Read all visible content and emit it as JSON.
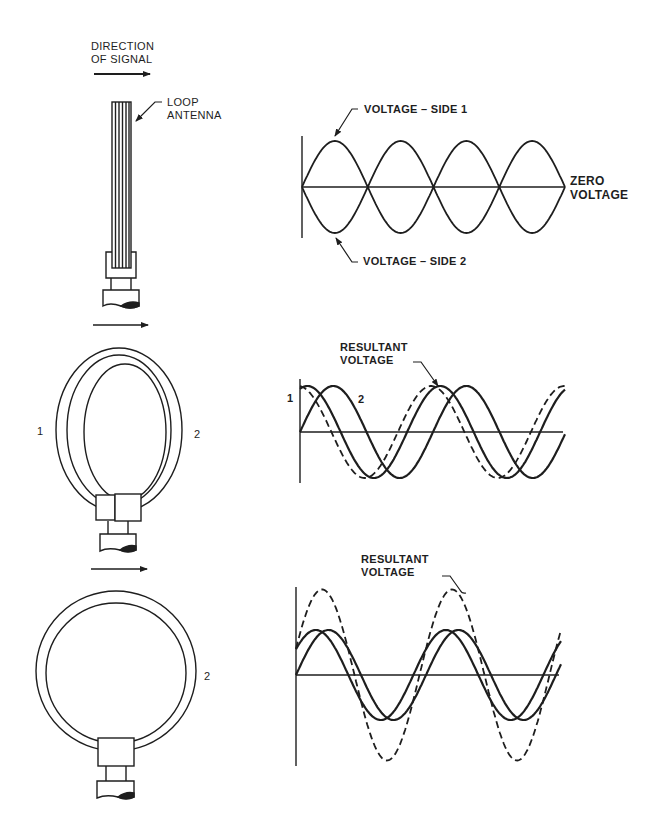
{
  "labels": {
    "direction_line1": "DIRECTION",
    "direction_line2": "OF SIGNAL",
    "loop_antenna_line1": "LOOP",
    "loop_antenna_line2": "ANTENNA",
    "voltage_side1": "VOLTAGE – SIDE 1",
    "voltage_side2": "VOLTAGE – SIDE 2",
    "zero_line1": "ZERO",
    "zero_line2": "VOLTAGE",
    "resultant_mid_line1": "RESULTANT",
    "resultant_mid_line2": "VOLTAGE",
    "resultant_bot_line1": "RESULTANT",
    "resultant_bot_line2": "VOLTAGE",
    "side1_mid": "1",
    "side2_mid": "2",
    "side1_graph": "1",
    "side2_graph": "2",
    "side2_bottom": "2"
  },
  "colors": {
    "ink": "#1e1e1e",
    "paper": "#ffffff"
  },
  "chart_data": [
    {
      "type": "line",
      "title": "Loop edge-on to signal",
      "description": "Voltages on side 1 and side 2 equal and opposite; resultant is zero",
      "x_range_px": [
        302,
        565
      ],
      "zero_y_px": 187,
      "series": [
        {
          "name": "VOLTAGE – SIDE 1",
          "amplitude": 1.0,
          "half_period_fraction": 0.25,
          "phase_deg": 0,
          "style": "solid",
          "rectified": "positive"
        },
        {
          "name": "VOLTAGE – SIDE 2",
          "amplitude": 1.0,
          "half_period_fraction": 0.25,
          "phase_deg": 0,
          "style": "solid",
          "rectified": "negative"
        }
      ],
      "annotations": [
        "VOLTAGE – SIDE 1",
        "VOLTAGE – SIDE 2",
        "ZERO VOLTAGE"
      ],
      "cycles_shown": 4
    },
    {
      "type": "line",
      "title": "Loop at intermediate angle",
      "x_range_px": [
        300,
        565
      ],
      "zero_y_px": 432,
      "series": [
        {
          "name": "1",
          "amplitude": 1.0,
          "phase_deg": 70,
          "style": "solid"
        },
        {
          "name": "2",
          "amplitude": 1.0,
          "phase_deg": 0,
          "style": "solid"
        },
        {
          "name": "RESULTANT VOLTAGE",
          "amplitude": 1.0,
          "phase_deg": 95,
          "style": "dashed"
        }
      ],
      "period_px": 133,
      "annotations": [
        "RESULTANT VOLTAGE",
        "1",
        "2"
      ]
    },
    {
      "type": "line",
      "title": "Loop broadside to signal",
      "x_range_px": [
        296,
        561
      ],
      "zero_y_px": 675,
      "series": [
        {
          "name": "1",
          "amplitude": 1.0,
          "phase_deg": 35,
          "style": "solid"
        },
        {
          "name": "2",
          "amplitude": 1.0,
          "phase_deg": 0,
          "style": "solid"
        },
        {
          "name": "RESULTANT VOLTAGE",
          "amplitude": 1.9,
          "phase_deg": 18,
          "style": "dashed"
        }
      ],
      "period_px": 130,
      "annotations": [
        "RESULTANT VOLTAGE"
      ]
    }
  ]
}
